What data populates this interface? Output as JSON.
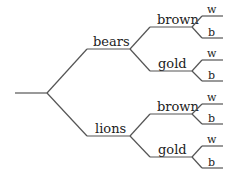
{
  "diagram": {
    "type": "tree",
    "root": {
      "label": "",
      "children": [
        {
          "label": "bears",
          "children": [
            {
              "label": "brown",
              "children": [
                {
                  "label": "w"
                },
                {
                  "label": "b"
                }
              ]
            },
            {
              "label": "gold",
              "children": [
                {
                  "label": "w"
                },
                {
                  "label": "b"
                }
              ]
            }
          ]
        },
        {
          "label": "lions",
          "children": [
            {
              "label": "brown",
              "children": [
                {
                  "label": "w"
                },
                {
                  "label": "b"
                }
              ]
            },
            {
              "label": "gold",
              "children": [
                {
                  "label": "w"
                },
                {
                  "label": "b"
                }
              ]
            }
          ]
        }
      ]
    },
    "colors": {
      "line": "#555555",
      "text": "#222222",
      "background": "#ffffff"
    }
  },
  "labels": {
    "bears": "bears",
    "lions": "lions",
    "bears_brown": "brown",
    "bears_gold": "gold",
    "lions_brown": "brown",
    "lions_gold": "gold",
    "bears_brown_w": "w",
    "bears_brown_b": "b",
    "bears_gold_w": "w",
    "bears_gold_b": "b",
    "lions_brown_w": "w",
    "lions_brown_b": "b",
    "lions_gold_w": "w",
    "lions_gold_b": "b"
  }
}
